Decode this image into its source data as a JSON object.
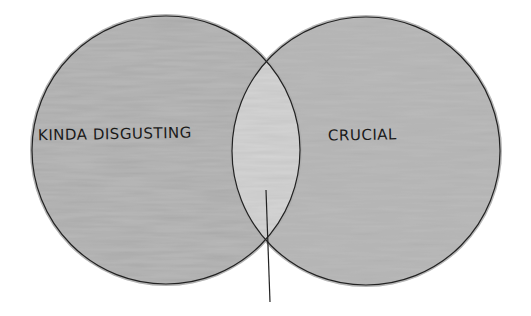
{
  "diagram": {
    "type": "venn",
    "sets": [
      {
        "label": "KINDA DISGUSTING",
        "fill": "#9e9e9e"
      },
      {
        "label": "CRUCIAL",
        "fill": "#a8a8a8"
      }
    ],
    "intersection": {
      "label": "",
      "fill": "#d4d4d4",
      "has_pointer_line": true
    },
    "stroke": "#222222"
  }
}
